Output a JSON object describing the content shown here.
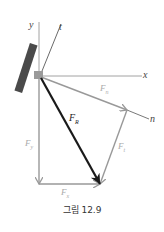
{
  "figure": {
    "caption": "그림 12.9",
    "colors": {
      "axis": "#8a8a8a",
      "component_vector": "#999999",
      "resultant_vector": "#1a1a1a",
      "plate": "#4a4a4a",
      "label_gray": "#aaaaaa",
      "label_dark": "#222222"
    },
    "axes": {
      "x": "x",
      "y": "y",
      "t": "t",
      "n": "n"
    },
    "vectors": {
      "resultant": {
        "symbol": "F",
        "sub": "R"
      },
      "normal": {
        "symbol": "F",
        "sub": "n"
      },
      "tangential": {
        "symbol": "F",
        "sub": "t"
      },
      "x_comp": {
        "symbol": "F",
        "sub": "x"
      },
      "y_comp": {
        "symbol": "F",
        "sub": "y"
      }
    }
  }
}
